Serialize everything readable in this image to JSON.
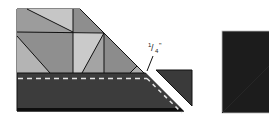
{
  "diagram": {
    "type": "quilt-seam-diagram",
    "annotation": {
      "seam_allowance_label": "1/4\"",
      "numerator": "1",
      "denominator": "4",
      "unit_mark": "\""
    },
    "colors": {
      "background": "#ffffff",
      "light_gray": "#c4c4c4",
      "mid_gray": "#9a9a9a",
      "dark_gray": "#8a8a8a",
      "strip_dark": "#3a3a3a",
      "square_black": "#1c1c1c",
      "outline": "#111111",
      "dash": "#e6e6e6"
    },
    "parts": [
      {
        "name": "pieced-triangle-unit",
        "description": "Patchwork of gray triangles trimmed at a 45-degree angle"
      },
      {
        "name": "dark-border-strip",
        "description": "Dark strip sewn along bottom with dashed stitching line"
      },
      {
        "name": "trimmed-corner-piece",
        "description": "Corner triangle cut off along the diagonal"
      },
      {
        "name": "black-square",
        "description": "Separate dark square to the right"
      }
    ]
  }
}
